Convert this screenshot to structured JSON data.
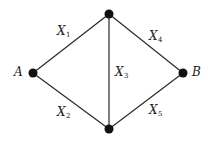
{
  "diagram": {
    "type": "network-graph",
    "colors": {
      "edge": "#2a2a2a",
      "node": "#111111",
      "text": "#222222",
      "background": "#ffffff"
    },
    "nodes": [
      {
        "id": "A",
        "label": "A",
        "x": 33,
        "y": 73
      },
      {
        "id": "T",
        "label": "",
        "x": 109,
        "y": 14
      },
      {
        "id": "M",
        "label": "",
        "x": 109,
        "y": 129
      },
      {
        "id": "B",
        "label": "B",
        "x": 183,
        "y": 73
      }
    ],
    "edges": [
      {
        "id": "X1",
        "from": "A",
        "to": "T",
        "var": "X",
        "sub": "1"
      },
      {
        "id": "X2",
        "from": "A",
        "to": "M",
        "var": "X",
        "sub": "2"
      },
      {
        "id": "X3",
        "from": "T",
        "to": "M",
        "var": "X",
        "sub": "3"
      },
      {
        "id": "X4",
        "from": "T",
        "to": "B",
        "var": "X",
        "sub": "4"
      },
      {
        "id": "X5",
        "from": "M",
        "to": "B",
        "var": "X",
        "sub": "5"
      }
    ]
  }
}
